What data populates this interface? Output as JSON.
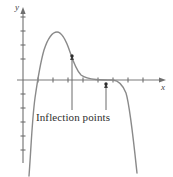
{
  "figure": {
    "title": "",
    "background_color": "#ffffff",
    "width": 173,
    "height": 177
  },
  "axes": {
    "x_label": "x",
    "y_label": "y",
    "x_axis_color": "#7a7a7a",
    "y_axis_color": "#6f6f6f",
    "x_axis_y_px": 80,
    "y_axis_x_px": 23,
    "x_ticks_px": [
      38,
      53,
      68,
      83,
      98,
      113,
      128,
      143
    ],
    "y_ticks_px": [
      17,
      31,
      45,
      59,
      94,
      108,
      122,
      136,
      150
    ],
    "tick_length_px": 5,
    "tick_color": "#6f6f6f",
    "arrow_color": "#6f6f6f",
    "grid": false,
    "tick_labels": []
  },
  "curve": {
    "color": "#8a8a8a",
    "width_px": 1.4,
    "description": "polynomial rising steeply from lower left, peak, decay to a flat plateau near the axis, then falling steeply to lower right",
    "path": "M 29,176 C 31,150 32,120 35,98 C 37,84 40,64 44,50 C 48,38 52,32 57,32 C 62,32 66,40 70,52 C 74,64 77,71 81,75 C 85,78 90,79 96,79.5 C 102,80 108,80 113,80 C 118,80.5 122,83 126,93 C 130,106 133,135 137,173"
  },
  "annotations": {
    "caption": "Inflection points",
    "caption_color": "#2e2e2e",
    "pointers": [
      {
        "name": "first-inflection-pointer",
        "point_x_px": 72,
        "point_y_px": 56,
        "line_from_x_px": 72,
        "line_from_y_px": 110,
        "dot_radius_px": 1.6,
        "color": "#4a4a4a"
      },
      {
        "name": "second-inflection-pointer",
        "point_x_px": 106,
        "point_y_px": 84,
        "line_from_x_px": 106,
        "line_from_y_px": 110,
        "dot_radius_px": 1.6,
        "color": "#4a4a4a"
      }
    ]
  },
  "chart_data": {
    "type": "line",
    "title": "",
    "xlabel": "x",
    "ylabel": "y",
    "grid": false,
    "legend": null,
    "xlim": [
      -1.0,
      9.0
    ],
    "ylim": [
      -6.5,
      4.5
    ],
    "annotations": [
      {
        "text": "Inflection points",
        "points": [
          {
            "x": 3.27,
            "y": 1.71
          },
          {
            "x": 5.53,
            "y": -0.29
          }
        ]
      }
    ],
    "tick_positions": {
      "x": [
        1,
        2,
        3,
        4,
        5,
        6,
        7,
        8
      ],
      "y": [
        -4.5,
        -3.5,
        -2.5,
        -1.5,
        -0.5,
        1,
        2,
        3,
        4
      ]
    },
    "series": [
      {
        "name": "f(x)",
        "x": [
          0.4,
          0.6,
          0.8,
          1.0,
          1.2,
          1.4,
          1.6,
          1.8,
          2.0,
          2.27,
          2.53,
          2.8,
          3.0,
          3.27,
          3.53,
          3.8,
          4.0,
          4.33,
          4.67,
          5.0,
          5.33,
          5.67,
          6.0,
          6.33,
          6.67,
          7.0,
          7.33,
          7.6
        ],
        "y": [
          -6.4,
          -5.2,
          -4.1,
          -3.1,
          -2.2,
          -1.3,
          -0.5,
          0.4,
          1.3,
          2.45,
          3.2,
          3.43,
          3.43,
          3.05,
          2.3,
          1.55,
          1.1,
          0.5,
          0.2,
          0.07,
          0.0,
          -0.02,
          -0.03,
          -0.45,
          -1.5,
          -3.0,
          -5.1,
          -6.6
        ]
      }
    ]
  }
}
